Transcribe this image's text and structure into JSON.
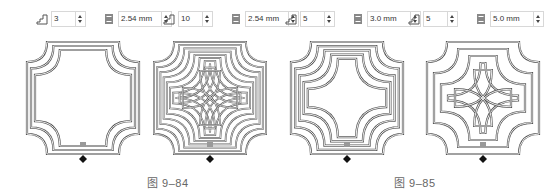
{
  "toolbars": [
    {
      "loops": "3",
      "spacing": "2.54 mm"
    },
    {
      "loops": "10",
      "spacing": "2.54 mm"
    },
    {
      "loops": "5",
      "spacing": "3.0 mm"
    },
    {
      "loops": "5",
      "spacing": "5.0 mm"
    }
  ],
  "icons": {
    "loops": "step-icon",
    "spacing": "spacing-icon"
  },
  "figures": [
    {
      "loops": 3,
      "gap": 4
    },
    {
      "loops": 10,
      "gap": 3.2
    },
    {
      "loops": 5,
      "gap": 4.2
    },
    {
      "loops": 5,
      "gap": 7
    }
  ],
  "captions": {
    "left": "图 9–84",
    "right": "图 9–85"
  },
  "colors": {
    "trace": "#555555",
    "fill": "#dddddd"
  }
}
